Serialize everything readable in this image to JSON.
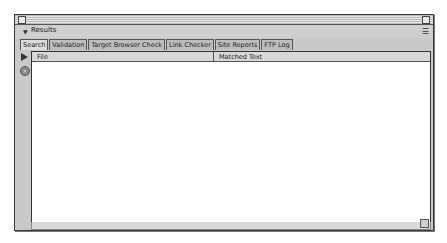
{
  "window": {
    "title_bar": "",
    "panel_title": "Results",
    "tabs": [
      {
        "label": "Search",
        "active": true
      },
      {
        "label": "Validation",
        "active": false
      },
      {
        "label": "Target Browser Check",
        "active": false
      },
      {
        "label": "Link Checker",
        "active": false
      },
      {
        "label": "Site Reports",
        "active": false
      },
      {
        "label": "FTP Log",
        "active": false
      }
    ],
    "table": {
      "columns": [
        "File",
        "Matched Text"
      ],
      "rows": []
    },
    "icons": {
      "disclosure": "▼",
      "options": "☰",
      "stop": "×"
    }
  }
}
